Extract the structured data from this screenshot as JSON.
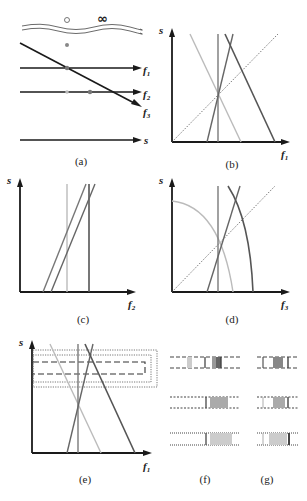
{
  "figure": {
    "panels": [
      {
        "id": "a",
        "caption": "(a)",
        "lines": [
          "f1",
          "f2",
          "f3",
          "s"
        ],
        "top_symbols": [
          "○",
          "∞"
        ]
      },
      {
        "id": "b",
        "caption": "(b)",
        "xlabel": "f",
        "xsub": "1",
        "ylabel": "s"
      },
      {
        "id": "c",
        "caption": "(c)",
        "xlabel": "f",
        "xsub": "2",
        "ylabel": "s"
      },
      {
        "id": "d",
        "caption": "(d)",
        "xlabel": "f",
        "xsub": "3",
        "ylabel": "s"
      },
      {
        "id": "e",
        "caption": "(e)",
        "xlabel": "f",
        "xsub": "1",
        "ylabel": "s"
      },
      {
        "id": "f",
        "caption": "(f)"
      },
      {
        "id": "g",
        "caption": "(g)"
      }
    ],
    "a_labels": {
      "f1": "f",
      "f1_sub": "1",
      "f2": "f",
      "f2_sub": "2",
      "f3": "f",
      "f3_sub": "3",
      "s": "s",
      "circle": "○",
      "infinity": "∞"
    },
    "colors": {
      "axis": "#1a1a1a",
      "dark_line": "#555555",
      "mid_line": "#7a7a7a",
      "light_line": "#bbbbbb",
      "dot": "#888888"
    }
  }
}
